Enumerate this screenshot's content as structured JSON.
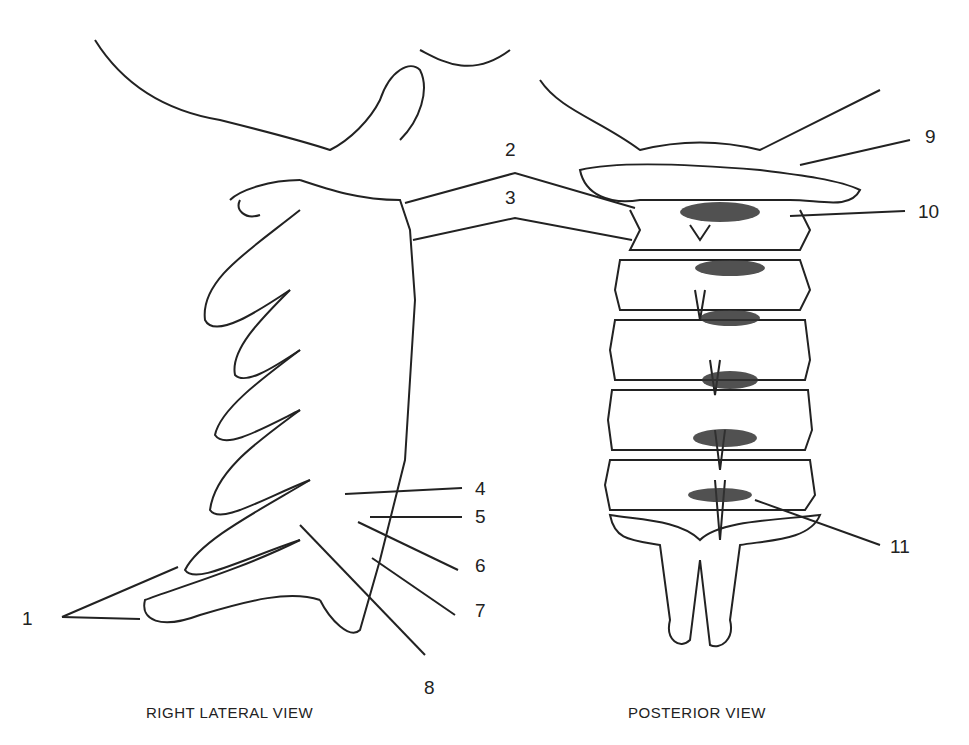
{
  "views": [
    {
      "caption": "RIGHT LATERAL VIEW"
    },
    {
      "caption": "POSTERIOR VIEW"
    }
  ],
  "labels": [
    {
      "id": "1",
      "text": "1",
      "x": 22,
      "y": 610
    },
    {
      "id": "2",
      "text": "2",
      "x": 505,
      "y": 141
    },
    {
      "id": "3",
      "text": "3",
      "x": 505,
      "y": 188
    },
    {
      "id": "4",
      "text": "4",
      "x": 475,
      "y": 480
    },
    {
      "id": "5",
      "text": "5",
      "x": 475,
      "y": 507
    },
    {
      "id": "6",
      "text": "6",
      "x": 475,
      "y": 555
    },
    {
      "id": "7",
      "text": "7",
      "x": 475,
      "y": 600
    },
    {
      "id": "8",
      "text": "8",
      "x": 424,
      "y": 678
    },
    {
      "id": "9",
      "text": "9",
      "x": 925,
      "y": 127
    },
    {
      "id": "10",
      "text": "10",
      "x": 920,
      "y": 202
    },
    {
      "id": "11",
      "text": "11",
      "x": 893,
      "y": 537
    }
  ]
}
